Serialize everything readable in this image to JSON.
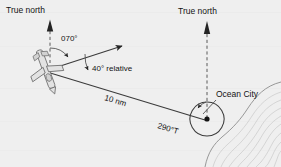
{
  "figure": {
    "type": "navigation-bearing-diagram",
    "background_color": "#efefef",
    "line_color": "#3b3b3b",
    "labels": {
      "true_north_left": "True north",
      "true_north_right": "True north",
      "magnetic_course": "070°",
      "relative_bearing": "40° relative",
      "distance": "10 nm",
      "reciprocal_bearing": "290°T",
      "destination": "Ocean City"
    },
    "values": {
      "course_deg": 70,
      "relative_bearing_deg": 40,
      "distance_nm": 10,
      "bearing_from_station_deg": 290,
      "bearing_suffix": "T"
    },
    "icons": {
      "aircraft": "airplane-icon",
      "station": "station-dot-icon",
      "north_arrow": "north-arrow-icon"
    }
  }
}
